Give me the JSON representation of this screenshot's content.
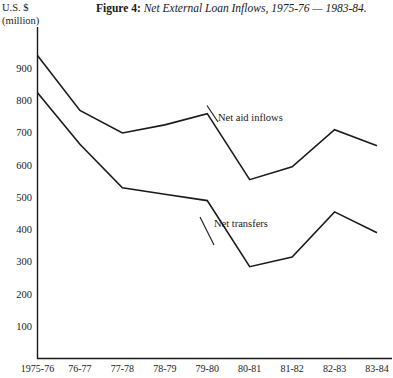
{
  "figure": {
    "label": "Figure 4:",
    "caption": "Net External Loan Inflows, 1975-76 — 1983-84.",
    "unit_line1": "U.S. $",
    "unit_line2": "(million)"
  },
  "annotations": {
    "aid_label": "Net aid inflows",
    "transfers_label": "Net transfers"
  },
  "chart_data": {
    "type": "line",
    "title": "Net External Loan Inflows, 1975-76 — 1983-84.",
    "xlabel": "",
    "ylabel": "U.S. $ (million)",
    "categories": [
      "1975-76",
      "76-77",
      "77-78",
      "78-79",
      "79-80",
      "80-81",
      "81-82",
      "82-83",
      "83-84"
    ],
    "series": [
      {
        "name": "Net aid inflows",
        "values": [
          940,
          770,
          700,
          725,
          760,
          555,
          595,
          710,
          660
        ]
      },
      {
        "name": "Net transfers",
        "values": [
          825,
          665,
          530,
          510,
          490,
          285,
          315,
          455,
          390
        ]
      }
    ],
    "ylim": [
      0,
      960
    ],
    "yticks": [
      100,
      200,
      300,
      400,
      500,
      600,
      700,
      800,
      900
    ],
    "ytick_labels": [
      "100",
      "200",
      "300",
      "400",
      "500",
      "600",
      "700",
      "800",
      "900"
    ],
    "grid": false,
    "legend_position": "inline-annotations",
    "line_color": "#1a1a1a",
    "axis_color": "#1a1a1a",
    "background": "#ffffff"
  }
}
